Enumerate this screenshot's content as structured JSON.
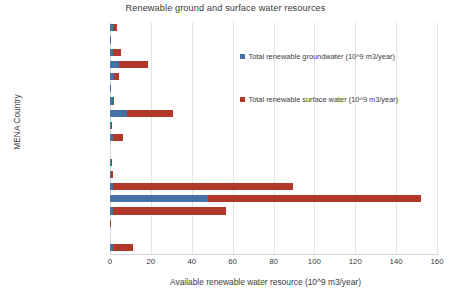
{
  "chart_data": {
    "type": "bar",
    "orientation": "horizontal",
    "stacked": true,
    "title": "Renewable ground and surface water resources",
    "xlabel": "Available renewable water resource (10^9 m3/year)",
    "ylabel": "MENA Country",
    "xlim": [
      0,
      160
    ],
    "xticks": [
      0,
      20,
      40,
      60,
      80,
      100,
      120,
      140,
      160
    ],
    "grid": "vertical",
    "legend_position": "inside-right",
    "categories": [
      "Yemen",
      "United Arab Emirates",
      "Tunisia",
      "Syrian Arab Republic",
      "Saudi Arabia",
      "Qatar",
      "Oman",
      "Morocco",
      "Libya",
      "Lebanon",
      "Kuwait",
      "Jordan",
      "Israel",
      "Iraq",
      "Iran Islamic Rep.",
      "Egypt",
      "Djibouti",
      "Bahrain",
      "Algeria"
    ],
    "series": [
      {
        "name": "Total renewable groundwater (10^9 m3/year)",
        "color": "#4472a8",
        "values": [
          1.5,
          0.12,
          1.4,
          4.4,
          2.2,
          0.05,
          1.3,
          8.3,
          0.6,
          1.5,
          0.0,
          0.45,
          0.5,
          1.5,
          48.0,
          1.3,
          0.0,
          0.0,
          1.7
        ]
      },
      {
        "name": "Total renewable surface water (10^9 m3/year)",
        "color": "#b0392a",
        "values": [
          2.0,
          0.0,
          4.2,
          14.1,
          2.2,
          0.0,
          0.6,
          22.5,
          0.2,
          4.8,
          0.0,
          0.25,
          0.8,
          88.0,
          104.0,
          55.7,
          0.3,
          0.0,
          9.6
        ]
      }
    ],
    "totals": [
      3.5,
      0.12,
      5.6,
      18.5,
      4.4,
      0.05,
      1.9,
      30.8,
      0.8,
      6.3,
      0.0,
      0.7,
      1.3,
      89.5,
      152.0,
      57.0,
      0.3,
      0.0,
      11.3
    ]
  },
  "legend": {
    "items": [
      {
        "label": "Total renewable groundwater (10^9 m3/year)",
        "color": "#4472a8"
      },
      {
        "label": "Total renewable surface water (10^9 m3/year)",
        "color": "#b0392a"
      }
    ]
  }
}
